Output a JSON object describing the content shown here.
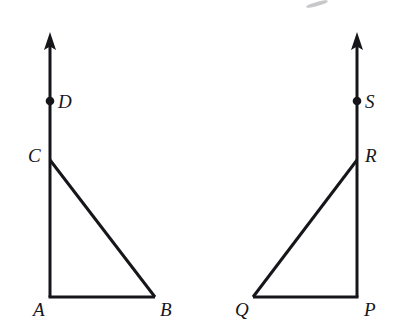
{
  "figure": {
    "stroke_color": "#16161a",
    "background_color": "#ffffff",
    "stroke_width": 3,
    "dot_radius": 4,
    "left_triangle": {
      "name": "triangle-ABC",
      "vertices": [
        {
          "label": "A",
          "x": 50,
          "y": 297,
          "label_x": 33,
          "label_y": 300
        },
        {
          "label": "B",
          "x": 155,
          "y": 297,
          "label_x": 160,
          "label_y": 300
        },
        {
          "label": "C",
          "x": 50,
          "y": 160,
          "label_x": 28,
          "label_y": 146
        }
      ],
      "ray": {
        "label": "ray-CD-up",
        "from_x": 50,
        "from_y": 160,
        "to_x": 50,
        "to_y": 33
      },
      "point_on_ray": {
        "label": "D",
        "x": 50,
        "y": 101,
        "label_x": 58,
        "label_y": 92
      },
      "right_angle_at": "A"
    },
    "right_triangle": {
      "name": "triangle-PQR",
      "vertices": [
        {
          "label": "P",
          "x": 357,
          "y": 297,
          "label_x": 364,
          "label_y": 300
        },
        {
          "label": "Q",
          "x": 253,
          "y": 297,
          "label_x": 235,
          "label_y": 300
        },
        {
          "label": "R",
          "x": 357,
          "y": 160,
          "label_x": 365,
          "label_y": 146
        }
      ],
      "ray": {
        "label": "ray-RS-up",
        "from_x": 357,
        "from_y": 160,
        "to_x": 357,
        "to_y": 33
      },
      "point_on_ray": {
        "label": "S",
        "x": 357,
        "y": 101,
        "label_x": 365,
        "label_y": 92
      },
      "right_angle_at": "P"
    },
    "cropped_top_text": {
      "left_fragment": "          ",
      "right_fragment": "        "
    }
  }
}
